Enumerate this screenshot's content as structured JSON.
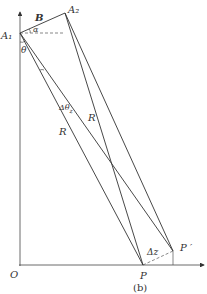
{
  "diagram": {
    "caption": "(b)",
    "labels": {
      "A1": "A₁",
      "A2": "A₂",
      "B": "B",
      "alpha": "α",
      "theta": "θ",
      "delta_theta": "Δθ",
      "delta_theta_sub": "z",
      "R_left": "R",
      "R_right": "R",
      "origin": "O",
      "P": "P",
      "P_prime": "P ′",
      "delta_z": "Δz"
    },
    "points": {
      "O": [
        20,
        265
      ],
      "A1": [
        20,
        33
      ],
      "A2": [
        65,
        13
      ],
      "P": [
        143,
        265
      ],
      "P_prime": [
        173,
        251
      ]
    },
    "line_color": "#333333"
  }
}
